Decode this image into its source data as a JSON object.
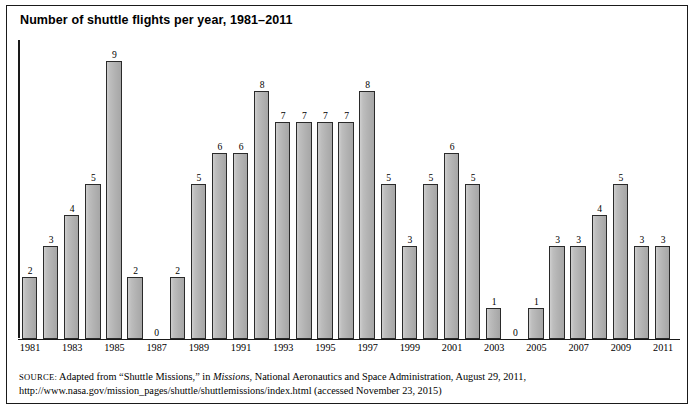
{
  "figure": {
    "title": "Number of shuttle flights per year, 1981–2011",
    "border_color": "#1a1a1a",
    "bar_fill_color": "#b9b9b9",
    "bar_border_color": "#2a2a2a"
  },
  "source": {
    "label": "SOURCE:",
    "text_before_italic": " Adapted from “Shuttle Missions,” in ",
    "italic_text": "Missions",
    "text_after_italic": ", National Aeronautics and Space Administration, August 29, 2011, http://www.nasa.gov/mission_pages/shuttle/shuttlemissions/index.html (accessed November 23, 2015)"
  },
  "chart_data": {
    "type": "bar",
    "title": "Number of shuttle flights per year, 1981–2011",
    "xlabel": "",
    "ylabel": "",
    "ylim": [
      0,
      9
    ],
    "grid": false,
    "legend": "none",
    "axis_tick_labels": [
      "1981",
      "1983",
      "1985",
      "1987",
      "1989",
      "1991",
      "1993",
      "1995",
      "1997",
      "1999",
      "2001",
      "2003",
      "2005",
      "2007",
      "2009",
      "2011"
    ],
    "categories": [
      "1981",
      "1982",
      "1983",
      "1984",
      "1985",
      "1986",
      "1987",
      "1988",
      "1989",
      "1990",
      "1991",
      "1992",
      "1993",
      "1994",
      "1995",
      "1996",
      "1997",
      "1998",
      "1999",
      "2000",
      "2001",
      "2002",
      "2003",
      "2004",
      "2005",
      "2006",
      "2007",
      "2008",
      "2009",
      "2010",
      "2011"
    ],
    "values": [
      2,
      3,
      4,
      5,
      9,
      2,
      0,
      2,
      5,
      6,
      6,
      8,
      7,
      7,
      7,
      7,
      8,
      5,
      3,
      5,
      6,
      5,
      1,
      0,
      1,
      3,
      3,
      4,
      5,
      3,
      3
    ],
    "data_labels": [
      "2",
      "3",
      "4",
      "5",
      "9",
      "2",
      "0",
      "2",
      "5",
      "6",
      "6",
      "8",
      "7",
      "7",
      "7",
      "7",
      "8",
      "5",
      "3",
      "5",
      "6",
      "5",
      "1",
      "0",
      "1",
      "3",
      "3",
      "4",
      "5",
      "3",
      "3"
    ]
  }
}
